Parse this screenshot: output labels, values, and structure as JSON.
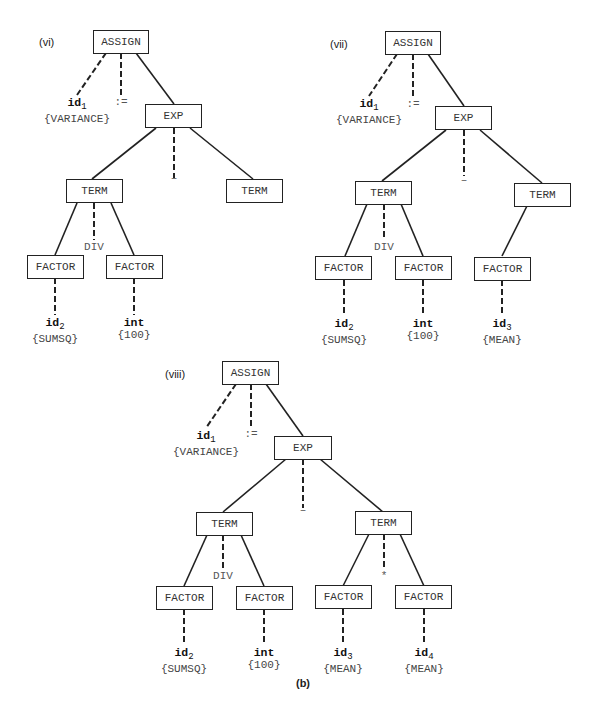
{
  "caption": "(b)",
  "trees": [
    {
      "tag": "(vi)",
      "nodes": {
        "assign": "ASSIGN",
        "exp": "EXP",
        "term_left": "TERM",
        "term_right": "TERM",
        "factor_1": "FACTOR",
        "factor_2": "FACTOR"
      },
      "ops": {
        "assign_op": ":=",
        "exp_op": "–",
        "term_op": "DIV"
      },
      "leaves": [
        {
          "token": "id",
          "sub": "1",
          "value": "{VARIANCE}"
        },
        {
          "token": "id",
          "sub": "2",
          "value": "{SUMSQ}"
        },
        {
          "token": "int",
          "sub": "",
          "value": "{100}"
        }
      ]
    },
    {
      "tag": "(vii)",
      "nodes": {
        "assign": "ASSIGN",
        "exp": "EXP",
        "term_left": "TERM",
        "term_right": "TERM",
        "factor_1": "FACTOR",
        "factor_2": "FACTOR",
        "factor_3": "FACTOR"
      },
      "ops": {
        "assign_op": ":=",
        "exp_op": "–",
        "term_op": "DIV"
      },
      "leaves": [
        {
          "token": "id",
          "sub": "1",
          "value": "{VARIANCE}"
        },
        {
          "token": "id",
          "sub": "2",
          "value": "{SUMSQ}"
        },
        {
          "token": "int",
          "sub": "",
          "value": "{100}"
        },
        {
          "token": "id",
          "sub": "3",
          "value": "{MEAN}"
        }
      ]
    },
    {
      "tag": "(viii)",
      "nodes": {
        "assign": "ASSIGN",
        "exp": "EXP",
        "term_left": "TERM",
        "term_right": "TERM",
        "factor_1": "FACTOR",
        "factor_2": "FACTOR",
        "factor_3": "FACTOR",
        "factor_4": "FACTOR"
      },
      "ops": {
        "assign_op": ":=",
        "exp_op": "–",
        "term_op": "DIV",
        "term_op_right": "*"
      },
      "leaves": [
        {
          "token": "id",
          "sub": "1",
          "value": "{VARIANCE}"
        },
        {
          "token": "id",
          "sub": "2",
          "value": "{SUMSQ}"
        },
        {
          "token": "int",
          "sub": "",
          "value": "{100}"
        },
        {
          "token": "id",
          "sub": "3",
          "value": "{MEAN}"
        },
        {
          "token": "id",
          "sub": "4",
          "value": "{MEAN}"
        }
      ]
    }
  ]
}
